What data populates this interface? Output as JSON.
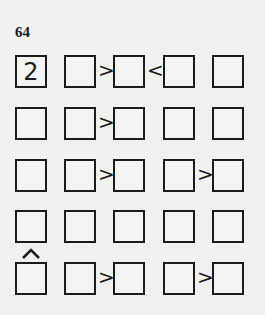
{
  "puzzle": {
    "number": "64",
    "size": 5,
    "grid": [
      [
        "2",
        "",
        "",
        "",
        ""
      ],
      [
        "",
        "",
        "",
        "",
        ""
      ],
      [
        "",
        "",
        "",
        "",
        ""
      ],
      [
        "",
        "",
        "",
        "",
        ""
      ],
      [
        "",
        "",
        "",
        "",
        ""
      ]
    ],
    "horizontal_inequalities": [
      {
        "row": 0,
        "between_cols": [
          1,
          2
        ],
        "symbol": ">"
      },
      {
        "row": 0,
        "between_cols": [
          2,
          3
        ],
        "symbol": "<"
      },
      {
        "row": 1,
        "between_cols": [
          1,
          2
        ],
        "symbol": ">"
      },
      {
        "row": 2,
        "between_cols": [
          1,
          2
        ],
        "symbol": ">"
      },
      {
        "row": 2,
        "between_cols": [
          3,
          4
        ],
        "symbol": ">"
      },
      {
        "row": 4,
        "between_cols": [
          1,
          2
        ],
        "symbol": ">"
      },
      {
        "row": 4,
        "between_cols": [
          3,
          4
        ],
        "symbol": ">"
      }
    ],
    "vertical_inequalities": [
      {
        "col": 0,
        "between_rows": [
          3,
          4
        ],
        "symbol": "^"
      }
    ]
  },
  "cells": {
    "r0c0": "2",
    "r0c1": "",
    "r0c2": "",
    "r0c3": "",
    "r0c4": "",
    "r1c0": "",
    "r1c1": "",
    "r1c2": "",
    "r1c3": "",
    "r1c4": "",
    "r2c0": "",
    "r2c1": "",
    "r2c2": "",
    "r2c3": "",
    "r2c4": "",
    "r3c0": "",
    "r3c1": "",
    "r3c2": "",
    "r3c3": "",
    "r3c4": "",
    "r4c0": "",
    "r4c1": "",
    "r4c2": "",
    "r4c3": "",
    "r4c4": ""
  },
  "symbols": {
    "gt": ">",
    "lt": "<"
  }
}
